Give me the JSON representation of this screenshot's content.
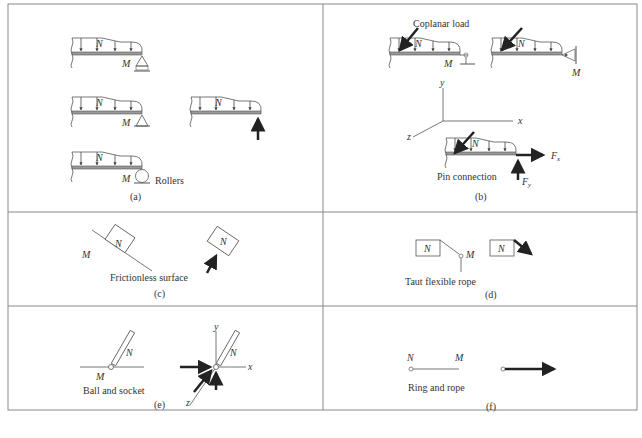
{
  "figure": {
    "panels": [
      {
        "id": "a",
        "caption": "(a)",
        "labels": {
          "rollers": "Rollers",
          "N": "N",
          "M": "M"
        }
      },
      {
        "id": "b",
        "caption": "(b)",
        "labels": {
          "coplanar_load": "Coplanar load",
          "pin_connection": "Pin connection",
          "N": "N",
          "M": "M",
          "x": "x",
          "y": "y",
          "z": "z",
          "Fx": "F",
          "Fx_sub": "x",
          "Fy": "F",
          "Fy_sub": "y"
        }
      },
      {
        "id": "c",
        "caption": "(c)",
        "labels": {
          "surface": "Frictionless surface",
          "N": "N",
          "M": "M"
        }
      },
      {
        "id": "d",
        "caption": "(d)",
        "labels": {
          "rope": "Taut flexible rope",
          "N": "N",
          "M": "M"
        }
      },
      {
        "id": "e",
        "caption": "(e)",
        "labels": {
          "joint": "Ball and socket",
          "N": "N",
          "M": "M",
          "x": "x",
          "y": "y",
          "z": "z"
        }
      },
      {
        "id": "f",
        "caption": "(f)",
        "labels": {
          "ring": "Ring and rope",
          "N": "N",
          "M": "M"
        }
      }
    ],
    "colors": {
      "line": "#555555",
      "arrow": "#222222",
      "border": "#888888"
    }
  }
}
